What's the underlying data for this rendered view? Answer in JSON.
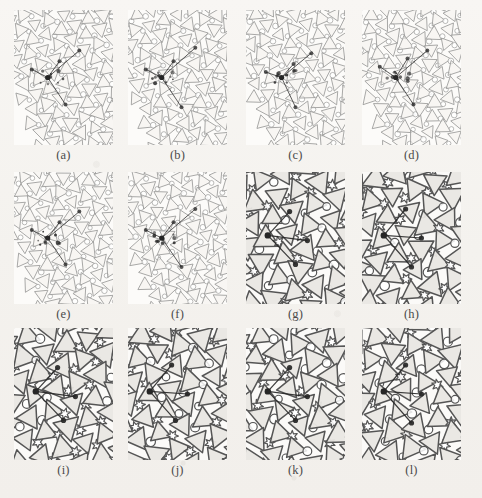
{
  "figure": {
    "kind": "crystal-lattice-tiling-panel-grid",
    "columns": 4,
    "rows": 3,
    "panel_count": 12,
    "background_color": "#f5f3f0",
    "light_line_color": "#9a9a98",
    "dark_line_color": "#555555",
    "marker_color": "#262626",
    "tile_fill_color": "#efedea"
  },
  "panels": [
    {
      "label": "(a)",
      "shade": "light",
      "x": 14,
      "y": 10,
      "w": 99,
      "h": 135,
      "caption_y": 148,
      "seed": 11,
      "tiling": "triangle-circle",
      "marker": {
        "cx": 0.34,
        "cy": 0.5,
        "arms": [
          [
            0.66,
            0.3
          ],
          [
            0.46,
            0.38
          ],
          [
            0.52,
            0.7
          ],
          [
            0.18,
            0.44
          ]
        ]
      }
    },
    {
      "label": "(b)",
      "shade": "light",
      "x": 128,
      "y": 10,
      "w": 99,
      "h": 135,
      "caption_y": 148,
      "seed": 23,
      "tiling": "triangle-circle",
      "marker": {
        "cx": 0.34,
        "cy": 0.5,
        "arms": [
          [
            0.68,
            0.28
          ],
          [
            0.46,
            0.38
          ],
          [
            0.54,
            0.72
          ],
          [
            0.18,
            0.44
          ]
        ]
      }
    },
    {
      "label": "(c)",
      "shade": "light",
      "x": 246,
      "y": 10,
      "w": 99,
      "h": 135,
      "caption_y": 148,
      "seed": 37,
      "tiling": "triangle-circle",
      "marker": {
        "cx": 0.36,
        "cy": 0.5,
        "arms": [
          [
            0.66,
            0.32
          ],
          [
            0.48,
            0.4
          ],
          [
            0.5,
            0.72
          ],
          [
            0.2,
            0.46
          ]
        ]
      }
    },
    {
      "label": "(d)",
      "shade": "light",
      "x": 362,
      "y": 10,
      "w": 99,
      "h": 135,
      "caption_y": 148,
      "seed": 53,
      "tiling": "triangle-circle",
      "marker": {
        "cx": 0.34,
        "cy": 0.5,
        "arms": [
          [
            0.66,
            0.3
          ],
          [
            0.46,
            0.36
          ],
          [
            0.52,
            0.7
          ],
          [
            0.18,
            0.42
          ]
        ]
      }
    },
    {
      "label": "(e)",
      "shade": "light",
      "x": 14,
      "y": 172,
      "w": 99,
      "h": 132,
      "caption_y": 307,
      "seed": 67,
      "tiling": "triangle-circle",
      "marker": {
        "cx": 0.34,
        "cy": 0.5,
        "arms": [
          [
            0.66,
            0.3
          ],
          [
            0.46,
            0.38
          ],
          [
            0.52,
            0.7
          ],
          [
            0.18,
            0.44
          ]
        ]
      }
    },
    {
      "label": "(f)",
      "shade": "light",
      "x": 128,
      "y": 172,
      "w": 99,
      "h": 132,
      "caption_y": 307,
      "seed": 79,
      "tiling": "triangle-circle",
      "marker": {
        "cx": 0.34,
        "cy": 0.5,
        "arms": [
          [
            0.68,
            0.28
          ],
          [
            0.46,
            0.38
          ],
          [
            0.54,
            0.72
          ],
          [
            0.18,
            0.44
          ]
        ]
      }
    },
    {
      "label": "(g)",
      "shade": "dark",
      "x": 246,
      "y": 172,
      "w": 99,
      "h": 132,
      "caption_y": 307,
      "seed": 97,
      "tiling": "triangle-star",
      "marker": {
        "cx": 0.22,
        "cy": 0.48,
        "arms": [
          [
            0.62,
            0.52
          ],
          [
            0.44,
            0.3
          ],
          [
            0.5,
            0.7
          ]
        ]
      }
    },
    {
      "label": "(h)",
      "shade": "dark",
      "x": 362,
      "y": 172,
      "w": 99,
      "h": 132,
      "caption_y": 307,
      "seed": 113,
      "tiling": "triangle-star",
      "marker": {
        "cx": 0.22,
        "cy": 0.48,
        "arms": [
          [
            0.6,
            0.5
          ],
          [
            0.44,
            0.28
          ],
          [
            0.5,
            0.72
          ]
        ]
      }
    },
    {
      "label": "(i)",
      "shade": "dark",
      "x": 14,
      "y": 328,
      "w": 99,
      "h": 132,
      "caption_y": 463,
      "seed": 131,
      "tiling": "triangle-star",
      "marker": {
        "cx": 0.22,
        "cy": 0.48,
        "arms": [
          [
            0.62,
            0.52
          ],
          [
            0.44,
            0.3
          ],
          [
            0.5,
            0.7
          ]
        ]
      }
    },
    {
      "label": "(j)",
      "shade": "dark",
      "x": 128,
      "y": 328,
      "w": 99,
      "h": 132,
      "caption_y": 463,
      "seed": 149,
      "tiling": "triangle-star",
      "marker": {
        "cx": 0.22,
        "cy": 0.48,
        "arms": [
          [
            0.6,
            0.5
          ],
          [
            0.44,
            0.28
          ],
          [
            0.48,
            0.7
          ]
        ]
      }
    },
    {
      "label": "(k)",
      "shade": "dark",
      "x": 246,
      "y": 328,
      "w": 99,
      "h": 132,
      "caption_y": 463,
      "seed": 167,
      "tiling": "triangle-star",
      "marker": {
        "cx": 0.22,
        "cy": 0.48,
        "arms": [
          [
            0.62,
            0.52
          ],
          [
            0.44,
            0.3
          ],
          [
            0.5,
            0.7
          ]
        ]
      }
    },
    {
      "label": "(l)",
      "shade": "dark",
      "x": 362,
      "y": 328,
      "w": 99,
      "h": 132,
      "caption_y": 463,
      "seed": 181,
      "tiling": "triangle-star",
      "marker": {
        "cx": 0.22,
        "cy": 0.48,
        "arms": [
          [
            0.6,
            0.5
          ],
          [
            0.44,
            0.28
          ],
          [
            0.5,
            0.72
          ]
        ]
      }
    }
  ]
}
